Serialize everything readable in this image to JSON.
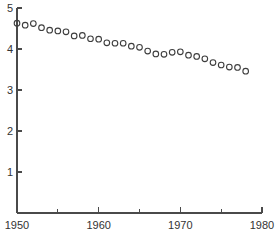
{
  "chart_data": {
    "type": "scatter",
    "title": "",
    "subtitle": "",
    "xlabel": "",
    "ylabel": "",
    "xlim": [
      1950,
      1980
    ],
    "ylim": [
      0,
      5
    ],
    "grid": false,
    "legend": null,
    "marker_style": "open-circle",
    "x_ticks_major": [
      1950,
      1960,
      1970,
      1980
    ],
    "x_ticks_minor": [
      1955,
      1965,
      1975
    ],
    "x_tick_labels": [
      "1950",
      "1960",
      "1970",
      "1980"
    ],
    "y_ticks_major": [
      1,
      2,
      3,
      4,
      5
    ],
    "y_tick_labels": [
      "1",
      "2",
      "3",
      "4",
      "5"
    ],
    "x": [
      1950,
      1951,
      1952,
      1953,
      1954,
      1955,
      1956,
      1957,
      1958,
      1959,
      1960,
      1961,
      1962,
      1963,
      1964,
      1965,
      1966,
      1967,
      1968,
      1969,
      1970,
      1971,
      1972,
      1973,
      1974,
      1975,
      1976,
      1977,
      1978
    ],
    "values": [
      4.63,
      4.58,
      4.62,
      4.52,
      4.46,
      4.44,
      4.42,
      4.32,
      4.33,
      4.25,
      4.24,
      4.15,
      4.14,
      4.14,
      4.07,
      4.04,
      3.95,
      3.88,
      3.87,
      3.92,
      3.93,
      3.85,
      3.82,
      3.76,
      3.67,
      3.61,
      3.56,
      3.55,
      3.46
    ],
    "series_name": ""
  },
  "axes": {
    "y_axis_name": "y-axis",
    "x_axis_name": "x-axis"
  }
}
